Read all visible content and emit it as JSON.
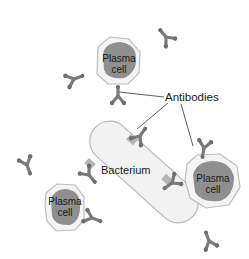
{
  "diagram": {
    "type": "biology-illustration",
    "labels": {
      "antibodies": "Antibodies",
      "bacterium": "Bacterium",
      "plasma_cell_top": {
        "line1": "Plasma",
        "line2": "cell"
      },
      "plasma_cell_right": {
        "line1": "Plasma",
        "line2": "cell"
      },
      "plasma_cell_bottom_left": {
        "line1": "Plasma",
        "line2": "cell"
      }
    },
    "elements": [
      {
        "kind": "plasma-cell",
        "position": "top-center"
      },
      {
        "kind": "plasma-cell",
        "position": "right"
      },
      {
        "kind": "plasma-cell",
        "position": "bottom-left"
      },
      {
        "kind": "bacterium",
        "position": "center",
        "shape": "rounded capsule, tilted"
      },
      {
        "kind": "antibody",
        "count": 11,
        "shape": "Y"
      }
    ],
    "callout": {
      "label": "Antibodies",
      "leader_lines": 3
    },
    "colors": {
      "background": "#ffffff",
      "cell_membrane": "#f4f4f4",
      "cell_outline": "#bdbdbd",
      "nucleus": "#8f8f8f",
      "antibody": "#7a7a7a",
      "bacterium_fill": "#f2f2f2",
      "bacterium_outline": "#b8b8b8",
      "receptor_patch": "#b5b5b5",
      "text": "#1a1a1a",
      "leader_line": "#333333"
    }
  }
}
